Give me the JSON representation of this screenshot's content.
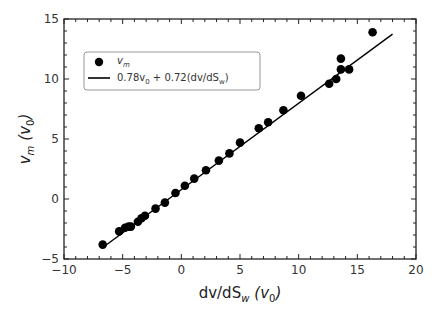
{
  "chart_data": {
    "type": "scatter",
    "title": "",
    "xlabel": "dv/dS_w (v_0)",
    "ylabel": "v_m (v_0)",
    "xlim": [
      -10,
      20
    ],
    "ylim": [
      -5,
      15
    ],
    "xticks": [
      -10,
      -5,
      0,
      5,
      10,
      15,
      20
    ],
    "yticks": [
      -5,
      0,
      5,
      10,
      15
    ],
    "grid": false,
    "legend_position": "upper left",
    "series": [
      {
        "name": "v_m",
        "kind": "scatter",
        "marker": "circle",
        "color": "#000000",
        "x": [
          -6.7,
          -5.3,
          -4.8,
          -4.5,
          -4.3,
          -3.7,
          -3.4,
          -3.1,
          -2.2,
          -1.4,
          -0.5,
          0.3,
          1.1,
          2.1,
          3.2,
          4.1,
          5.0,
          6.6,
          7.4,
          8.7,
          10.2,
          12.6,
          13.2,
          13.6,
          13.6,
          14.3,
          16.3
        ],
        "y": [
          -3.8,
          -2.7,
          -2.4,
          -2.3,
          -2.3,
          -1.9,
          -1.6,
          -1.4,
          -0.8,
          -0.3,
          0.5,
          1.1,
          1.7,
          2.4,
          3.2,
          3.8,
          4.7,
          5.9,
          6.4,
          7.4,
          8.6,
          9.6,
          10.0,
          10.8,
          11.7,
          10.8,
          13.9
        ]
      },
      {
        "name": "0.78v_0 + 0.72(dv/dS_w)",
        "kind": "line",
        "color": "#000000",
        "x": [
          -6.7,
          18.0
        ],
        "y": [
          -4.04,
          13.74
        ]
      }
    ]
  },
  "legend": {
    "entries": [
      {
        "label_main": "v",
        "label_sub": "m"
      },
      {
        "label_a": "0.78v",
        "label_a_sub": "0",
        "label_b": " + 0.72(dv/dS",
        "label_b_sub": "w",
        "label_c": ")"
      }
    ]
  },
  "axes": {
    "xlabel_main": "dv/dS",
    "xlabel_sub": "w",
    "xlabel_unit": "(v",
    "xlabel_unit_sub": "0",
    "xlabel_close": ")",
    "ylabel_main": "v",
    "ylabel_sub": "m",
    "ylabel_unit": "(v",
    "ylabel_unit_sub": "0",
    "ylabel_close": ")",
    "xtick_labels": [
      "−10",
      "−5",
      "0",
      "5",
      "10",
      "15",
      "20"
    ],
    "ytick_labels": [
      "−5",
      "0",
      "5",
      "10",
      "15"
    ]
  }
}
